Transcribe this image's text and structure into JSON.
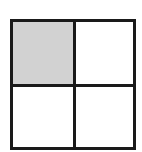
{
  "diagram": {
    "type": "grid",
    "rows": 2,
    "cols": 2,
    "cells": [
      {
        "row": 0,
        "col": 0,
        "shaded": true
      },
      {
        "row": 0,
        "col": 1,
        "shaded": false
      },
      {
        "row": 1,
        "col": 0,
        "shaded": false
      },
      {
        "row": 1,
        "col": 1,
        "shaded": false
      }
    ],
    "colors": {
      "border": "#1a1a1a",
      "shaded_fill": "#d2d2d2",
      "background": "#ffffff"
    }
  }
}
